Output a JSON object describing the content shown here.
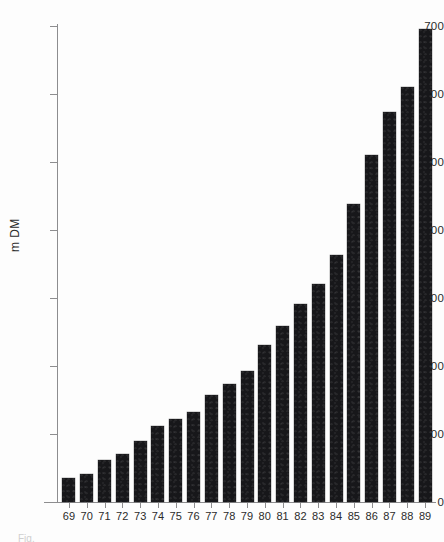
{
  "figure": {
    "background_color": "#ffffff",
    "bar_color": "#17171a",
    "axis_color": "#8d8d8f",
    "caption_partial": "Fig."
  },
  "chart_data": {
    "type": "bar",
    "title": "",
    "subtitle": "",
    "xlabel": "",
    "ylabel": "m DM",
    "ylim": [
      0,
      700
    ],
    "xlim_note": "categorical",
    "grid": false,
    "legend": "none",
    "y_ticks": [
      0,
      100,
      200,
      300,
      400,
      500,
      600,
      700
    ],
    "y_tick_labels": [
      "0",
      "100",
      "200",
      "300",
      "400",
      "500",
      "600",
      "700"
    ],
    "categories": [
      "69",
      "70",
      "71",
      "72",
      "73",
      "74",
      "75",
      "76",
      "77",
      "78",
      "79",
      "80",
      "81",
      "82",
      "83",
      "84",
      "85",
      "86",
      "87",
      "88",
      "89"
    ],
    "values": [
      35,
      41,
      62,
      70,
      90,
      112,
      122,
      132,
      157,
      174,
      192,
      231,
      259,
      291,
      320,
      363,
      438,
      511,
      573,
      611,
      695
    ],
    "series": [
      {
        "name": "m DM",
        "values": [
          35,
          41,
          62,
          70,
          90,
          112,
          122,
          132,
          157,
          174,
          192,
          231,
          259,
          291,
          320,
          363,
          438,
          511,
          573,
          611,
          695
        ]
      }
    ]
  }
}
